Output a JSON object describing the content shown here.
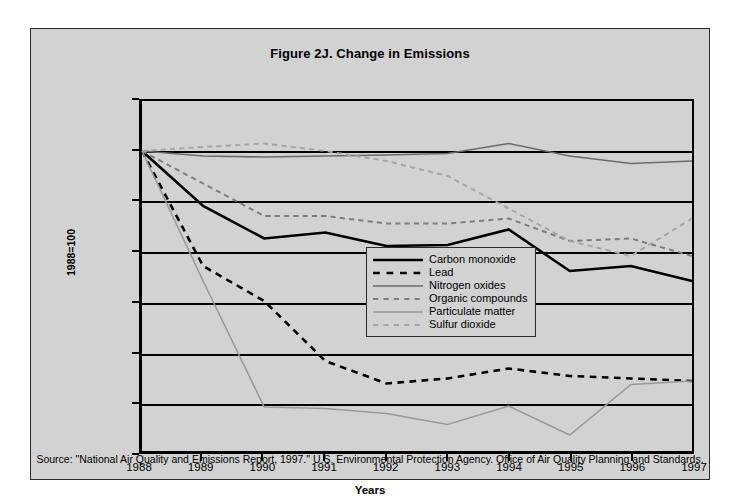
{
  "figure": {
    "title": "Figure 2J. Change in Emissions",
    "source_note": "Source: \"National Air Quality and Emissions Report, 1997.\" U.S. Environmental Protection Agency.  Office of Air Quality Planning and Standards.",
    "panel_bg": "#d2d2d2",
    "axis_color": "#000000"
  },
  "legend": {
    "position": "inside-center",
    "entries": [
      {
        "label": "Carbon monoxide",
        "color": "#000000",
        "style": "solid",
        "width": 2.6
      },
      {
        "label": "Lead",
        "color": "#000000",
        "style": "dashed",
        "width": 2.6
      },
      {
        "label": "Nitrogen oxides",
        "color": "#6b6b6b",
        "style": "solid",
        "width": 1.6
      },
      {
        "label": "Organic compounds",
        "color": "#7d7d7d",
        "style": "dashed",
        "width": 2.0
      },
      {
        "label": "Particulate matter",
        "color": "#9a9a9a",
        "style": "solid",
        "width": 1.6
      },
      {
        "label": "Sulfur dioxide",
        "color": "#a6a6a6",
        "style": "dashed",
        "width": 2.0
      }
    ]
  },
  "chart_data": {
    "type": "line",
    "title": "Figure 2J. Change in Emissions",
    "xlabel": "Years",
    "ylabel": "1988=100",
    "x": [
      1988,
      1989,
      1990,
      1991,
      1992,
      1993,
      1994,
      1995,
      1996,
      1997
    ],
    "categories": [
      "1988",
      "1989",
      "1990",
      "1991",
      "1992",
      "1993",
      "1994",
      "1995",
      "1996",
      "1997"
    ],
    "xlim": [
      1988,
      1997
    ],
    "ylim": [
      40,
      110
    ],
    "yticks": [
      40,
      50,
      60,
      70,
      80,
      90,
      100,
      110
    ],
    "grid": "horizontal",
    "series": [
      {
        "name": "Carbon monoxide",
        "color": "#000000",
        "style": "solid",
        "values": [
          100,
          89.0,
          82.5,
          83.7,
          81.0,
          81.2,
          84.3,
          76.0,
          77.0,
          74.0
        ]
      },
      {
        "name": "Lead",
        "color": "#000000",
        "style": "dashed",
        "values": [
          100,
          77.0,
          70.0,
          58.0,
          53.5,
          54.5,
          56.5,
          55.0,
          54.5,
          54.0
        ]
      },
      {
        "name": "Nitrogen oxides",
        "color": "#6b6b6b",
        "style": "solid",
        "values": [
          100,
          99.0,
          98.8,
          99.0,
          99.2,
          99.5,
          101.5,
          99.0,
          97.5,
          98.0
        ]
      },
      {
        "name": "Organic compounds",
        "color": "#7d7d7d",
        "style": "dashed",
        "values": [
          100,
          93.5,
          87.0,
          87.0,
          85.5,
          85.5,
          86.5,
          82.0,
          82.5,
          79.0
        ]
      },
      {
        "name": "Particulate matter",
        "color": "#9a9a9a",
        "style": "solid",
        "values": [
          100,
          74.0,
          48.8,
          48.5,
          47.5,
          45.3,
          49.0,
          43.2,
          53.3,
          54.0
        ]
      },
      {
        "name": "Sulfur dioxide",
        "color": "#a6a6a6",
        "style": "dashed",
        "values": [
          100,
          100.8,
          101.5,
          100.0,
          98.0,
          95.0,
          88.5,
          82.0,
          79.0,
          86.5
        ]
      }
    ]
  }
}
